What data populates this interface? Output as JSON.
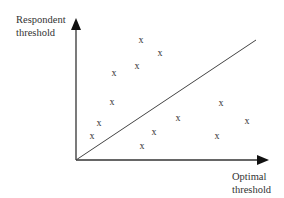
{
  "diagram": {
    "y_axis_label": [
      "Respondent",
      "threshold"
    ],
    "x_axis_label": [
      "Optimal",
      "threshold"
    ],
    "marker_glyph": "x",
    "points_above_line": [
      [
        141,
        40
      ],
      [
        160,
        53
      ],
      [
        137,
        66
      ],
      [
        114,
        73
      ],
      [
        112,
        102
      ],
      [
        99,
        123
      ],
      [
        92,
        136
      ]
    ],
    "points_below_line": [
      [
        221,
        103
      ],
      [
        247,
        121
      ],
      [
        217,
        136
      ],
      [
        178,
        118
      ],
      [
        154,
        132
      ],
      [
        142,
        146
      ]
    ],
    "line_color": "#333333"
  }
}
